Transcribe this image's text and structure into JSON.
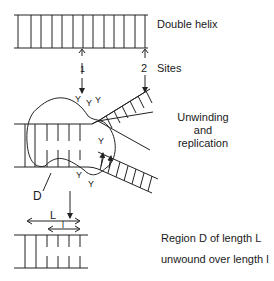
{
  "diagram": {
    "type": "dna-replication-schematic",
    "labels": {
      "double_helix": "Double helix",
      "sites": "Sites",
      "site_1": "1",
      "site_2": "2",
      "unwinding_1": "Unwinding",
      "unwinding_2": "and",
      "unwinding_3": "replication",
      "region_d": "D",
      "length_L": "L",
      "length_l": "l",
      "region_desc_1": "Region D of length L",
      "region_desc_2": "unwound over length l"
    },
    "stages": [
      {
        "name": "Double helix",
        "description": "Intact double-stranded DNA with two sites marked"
      },
      {
        "name": "Unwinding and replication",
        "description": "Fork opening at region D with proteins bound"
      },
      {
        "name": "Region D of length L unwound over length l",
        "description": "Resulting partially unwound region"
      }
    ],
    "colors": {
      "line": "#222222",
      "background": "#ffffff"
    }
  }
}
